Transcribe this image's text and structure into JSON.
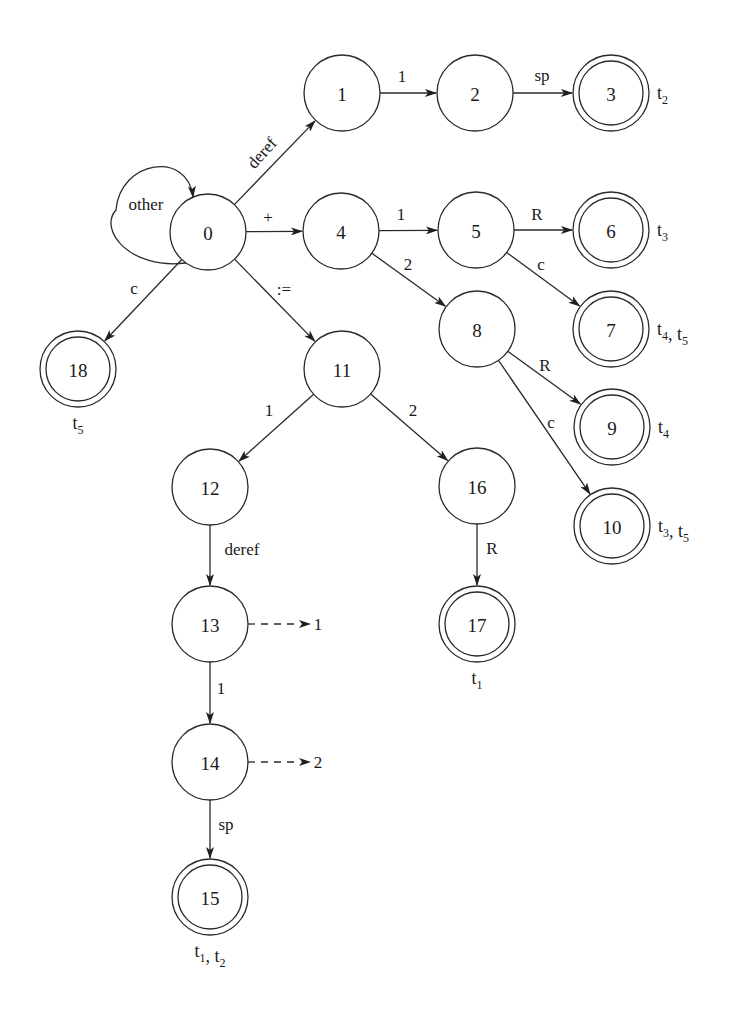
{
  "diagram": {
    "type": "finite-state-automaton",
    "nodes": [
      {
        "id": "0",
        "x": 208,
        "y": 232,
        "accepting": false
      },
      {
        "id": "1",
        "x": 342,
        "y": 93,
        "accepting": false
      },
      {
        "id": "2",
        "x": 475,
        "y": 93,
        "accepting": false
      },
      {
        "id": "3",
        "x": 611,
        "y": 93,
        "accepting": true,
        "tokens": [
          [
            "t",
            "2"
          ]
        ],
        "token_pos": "right"
      },
      {
        "id": "4",
        "x": 341,
        "y": 231,
        "accepting": false
      },
      {
        "id": "5",
        "x": 476,
        "y": 230,
        "accepting": false
      },
      {
        "id": "6",
        "x": 611,
        "y": 230,
        "accepting": true,
        "tokens": [
          [
            "t",
            "3"
          ]
        ],
        "token_pos": "right"
      },
      {
        "id": "7",
        "x": 611,
        "y": 329,
        "accepting": true,
        "tokens": [
          [
            "t",
            "4"
          ],
          [
            "t",
            "5"
          ]
        ],
        "token_pos": "right"
      },
      {
        "id": "8",
        "x": 477,
        "y": 329,
        "accepting": false
      },
      {
        "id": "9",
        "x": 612,
        "y": 427,
        "accepting": true,
        "tokens": [
          [
            "t",
            "4"
          ]
        ],
        "token_pos": "right"
      },
      {
        "id": "10",
        "x": 612,
        "y": 526,
        "accepting": true,
        "tokens": [
          [
            "t",
            "3"
          ],
          [
            "t",
            "5"
          ]
        ],
        "token_pos": "right"
      },
      {
        "id": "11",
        "x": 342,
        "y": 369,
        "accepting": false
      },
      {
        "id": "12",
        "x": 210,
        "y": 487,
        "accepting": false
      },
      {
        "id": "13",
        "x": 210,
        "y": 624,
        "accepting": false
      },
      {
        "id": "14",
        "x": 210,
        "y": 762,
        "accepting": false
      },
      {
        "id": "15",
        "x": 210,
        "y": 897,
        "accepting": true,
        "tokens": [
          [
            "t",
            "1"
          ],
          [
            "t",
            "2"
          ]
        ],
        "token_pos": "below"
      },
      {
        "id": "16",
        "x": 477,
        "y": 486,
        "accepting": false
      },
      {
        "id": "17",
        "x": 477,
        "y": 624,
        "accepting": true,
        "tokens": [
          [
            "t",
            "1"
          ]
        ],
        "token_pos": "below"
      },
      {
        "id": "18",
        "x": 78,
        "y": 369,
        "accepting": true,
        "tokens": [
          [
            "t",
            "5"
          ]
        ],
        "token_pos": "below"
      }
    ],
    "edges": [
      {
        "from": "0",
        "to": "1",
        "label": "deref",
        "lx": 262,
        "ly": 153,
        "rotate": -48
      },
      {
        "from": "1",
        "to": "2",
        "label": "1",
        "lx": 402,
        "ly": 76
      },
      {
        "from": "2",
        "to": "3",
        "label": "sp",
        "lx": 542,
        "ly": 75
      },
      {
        "from": "0",
        "to": "4",
        "label": "+",
        "lx": 268,
        "ly": 217
      },
      {
        "from": "4",
        "to": "5",
        "label": "1",
        "lx": 401,
        "ly": 214
      },
      {
        "from": "4",
        "to": "8",
        "label": "2",
        "lx": 408,
        "ly": 264
      },
      {
        "from": "5",
        "to": "6",
        "label": "R",
        "lx": 537,
        "ly": 214
      },
      {
        "from": "5",
        "to": "7",
        "label": "c",
        "lx": 541,
        "ly": 264
      },
      {
        "from": "8",
        "to": "9",
        "label": "R",
        "lx": 545,
        "ly": 365
      },
      {
        "from": "8",
        "to": "10",
        "label": "c",
        "lx": 551,
        "ly": 422
      },
      {
        "from": "0",
        "to": "18",
        "label": "c",
        "lx": 134,
        "ly": 288
      },
      {
        "from": "0",
        "to": "11",
        "label": ":=",
        "lx": 284,
        "ly": 289
      },
      {
        "from": "11",
        "to": "12",
        "label": "1",
        "lx": 269,
        "ly": 410
      },
      {
        "from": "11",
        "to": "16",
        "label": "2",
        "lx": 413,
        "ly": 410
      },
      {
        "from": "12",
        "to": "13",
        "label": "deref",
        "lx": 242,
        "ly": 549
      },
      {
        "from": "16",
        "to": "17",
        "label": "R",
        "lx": 492,
        "ly": 548
      },
      {
        "from": "13",
        "to": "14",
        "label": "1",
        "lx": 221,
        "ly": 688
      },
      {
        "from": "14",
        "to": "15",
        "label": "sp",
        "lx": 226,
        "ly": 824
      }
    ],
    "self_loops": [
      {
        "node": "0",
        "label": "other",
        "cx": 150,
        "cy": 210,
        "rx": 34,
        "ry": 42,
        "lx": 146,
        "ly": 204
      }
    ],
    "dashed_edges": [
      {
        "from": "13",
        "target_label": "1",
        "x1": 248,
        "x2": 300,
        "y": 624,
        "lx": 318
      },
      {
        "from": "14",
        "target_label": "2",
        "x1": 248,
        "x2": 300,
        "y": 762,
        "lx": 318
      }
    ],
    "node_radius": 38,
    "inner_radius": 32
  }
}
